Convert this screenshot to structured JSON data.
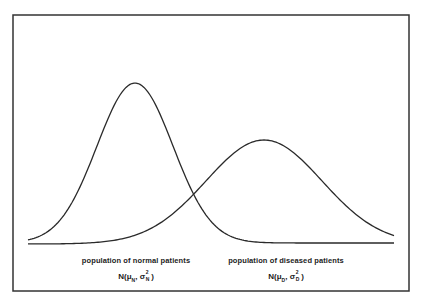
{
  "diagram": {
    "type": "two overlapping normal distribution curves",
    "frame": {
      "x": 13,
      "y": 15,
      "width": 396,
      "height": 276,
      "stroke": "#333333"
    },
    "curve_color": "#2a2a2a",
    "baseline_y": 243
  },
  "curves": [
    {
      "id": "normal",
      "label": "population of normal patients",
      "formula": {
        "prefix": "N(",
        "mu": "μ",
        "mu_sub": "N",
        "sep": ", ",
        "sigma": "σ",
        "sigma_sup": "2",
        "sigma_sub": "N",
        "suffix": ")"
      },
      "peak_x": 135,
      "peak_y": 83,
      "sigma_px": 38,
      "baseline": 243,
      "x_start": 28,
      "x_end": 394,
      "label_x": 136,
      "label_y": 256,
      "formula_y": 272
    },
    {
      "id": "diseased",
      "label": "population of diseased patients",
      "formula": {
        "prefix": "N(",
        "mu": "μ",
        "mu_sub": "D",
        "sep": ", ",
        "sigma": "σ",
        "sigma_sup": "2",
        "sigma_sub": "D",
        "suffix": ")"
      },
      "peak_x": 264,
      "peak_y": 140,
      "sigma_px": 58,
      "baseline": 244,
      "x_start": 28,
      "x_end": 394,
      "label_x": 286,
      "label_y": 256,
      "formula_y": 272
    }
  ]
}
